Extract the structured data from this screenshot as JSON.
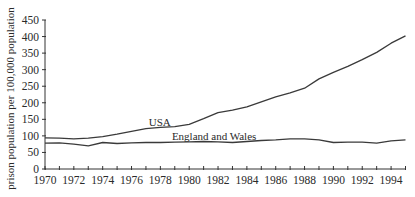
{
  "chart_data": {
    "type": "line",
    "title": "",
    "xlabel": "",
    "ylabel": "prison population per 100,000 population",
    "xlim": [
      1970,
      1995
    ],
    "ylim": [
      0,
      450
    ],
    "grid": false,
    "x": [
      1970,
      1971,
      1972,
      1973,
      1974,
      1975,
      1976,
      1977,
      1978,
      1979,
      1980,
      1981,
      1982,
      1983,
      1984,
      1985,
      1986,
      1987,
      1988,
      1989,
      1990,
      1991,
      1992,
      1993,
      1994,
      1995
    ],
    "x_ticks": [
      1970,
      1971,
      1972,
      1973,
      1974,
      1975,
      1976,
      1977,
      1978,
      1979,
      1980,
      1981,
      1982,
      1983,
      1984,
      1985,
      1986,
      1987,
      1988,
      1989,
      1990,
      1991,
      1992,
      1993,
      1994,
      1995
    ],
    "x_tick_labels": [
      "1970",
      "1972",
      "1974",
      "1976",
      "1978",
      "1980",
      "1982",
      "1984",
      "1986",
      "1988",
      "1990",
      "1992",
      "1994"
    ],
    "x_tick_label_values": [
      1970,
      1972,
      1974,
      1976,
      1978,
      1980,
      1982,
      1984,
      1986,
      1988,
      1990,
      1992,
      1994
    ],
    "y_ticks": [
      0,
      50,
      100,
      150,
      200,
      250,
      300,
      350,
      400,
      450
    ],
    "y_tick_labels": [
      "0",
      "50",
      "100",
      "150",
      "200",
      "250",
      "300",
      "350",
      "400",
      "450"
    ],
    "series": [
      {
        "name": "USA",
        "label_at": [
          1977.2,
          130
        ],
        "values": [
          94,
          93,
          91,
          93,
          98,
          105,
          114,
          122,
          126,
          128,
          135,
          152,
          170,
          178,
          188,
          203,
          218,
          230,
          244,
          272,
          292,
          310,
          330,
          352,
          380,
          402
        ]
      },
      {
        "name": "England and Wales",
        "label_at": [
          1978.8,
          89
        ],
        "values": [
          78,
          79,
          75,
          70,
          80,
          77,
          79,
          80,
          80,
          81,
          82,
          83,
          82,
          80,
          83,
          86,
          88,
          91,
          91,
          88,
          80,
          81,
          81,
          78,
          85,
          88
        ]
      }
    ],
    "legend": "inline"
  }
}
